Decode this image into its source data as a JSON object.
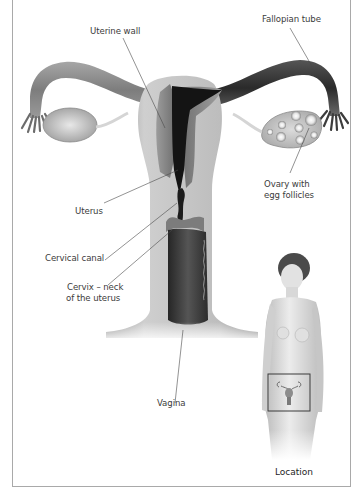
{
  "diagram": {
    "labels": {
      "uterine_wall": "Uterine wall",
      "fallopian_tube": "Fallopian tube",
      "ovary_line1": "Ovary with",
      "ovary_line2": "egg follicles",
      "uterus": "Uterus",
      "cervical_canal": "Cervical canal",
      "cervix_line1": "Cervix – neck",
      "cervix_line2": "of the uterus",
      "vagina": "Vagina"
    },
    "inset": {
      "caption": "Location",
      "description": "Standing female figure with box marking pelvic location of uterus"
    },
    "colors": {
      "frame": "#a9a9a9",
      "leader_line": "#4a4a4a",
      "tissue_light": "#c9c9c9",
      "tissue_mid": "#8e8e8e",
      "tissue_dark": "#3a3a3a",
      "cavity": "#141414",
      "skin": "#dcdcdc",
      "hair": "#4a4a4a"
    }
  }
}
